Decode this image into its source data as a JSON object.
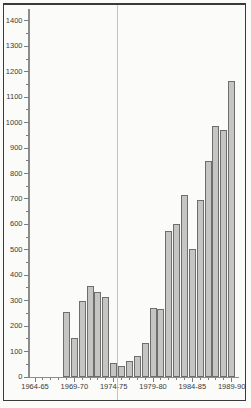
{
  "chart_data": {
    "type": "bar",
    "title": "",
    "xlabel": "",
    "ylabel": "",
    "ylim": [
      0,
      1400
    ],
    "y_major_tick_step": 100,
    "y_minor_tick_step": 50,
    "y_tick_labels": [
      "0",
      "100",
      "200",
      "300",
      "400",
      "500",
      "600",
      "700",
      "800",
      "900",
      "1000",
      "1100",
      "1200",
      "1300",
      "1400"
    ],
    "x_major_tick_labels": [
      "1964-65",
      "1969-70",
      "1974-75",
      "1979-80",
      "1984-85",
      "1989-90"
    ],
    "x_minor_tick_every_years": 1,
    "x_major_tick_every_years": 5,
    "first_bar_year_offset": 4,
    "categories": [
      "1968-69",
      "1969-70",
      "1970-71",
      "1971-72",
      "1972-73",
      "1973-74",
      "1974-75",
      "1975-76",
      "1976-77",
      "1977-78",
      "1978-79",
      "1979-80",
      "1980-81",
      "1981-82",
      "1982-83",
      "1983-84",
      "1984-85",
      "1985-86",
      "1986-87",
      "1987-88",
      "1988-89",
      "1989-90"
    ],
    "values": [
      255,
      153,
      298,
      358,
      335,
      313,
      55,
      45,
      63,
      82,
      135,
      271,
      267,
      574,
      602,
      716,
      502,
      698,
      850,
      987,
      970,
      1165
    ],
    "grid": "off",
    "legend": "none",
    "colors": {
      "background": "#fbfbf9",
      "frame": "#3a3a3a",
      "axis": "#8c8c8c",
      "tick": "#7d7d7d",
      "label_text": "#3a3a3a",
      "bar_fill": "#c5c5c3",
      "bar_border": "#6e6e6e",
      "fold_line": "#b5b5b5"
    }
  }
}
